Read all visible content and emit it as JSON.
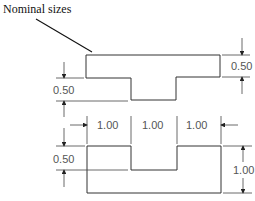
{
  "title": "Nominal sizes",
  "top_part": {
    "dimension_right": "0.50",
    "dimension_left": "0.50"
  },
  "bottom_part": {
    "width_labels": [
      "1.00",
      "1.00",
      "1.00"
    ],
    "dimension_left": "0.50",
    "dimension_right": "1.00"
  }
}
